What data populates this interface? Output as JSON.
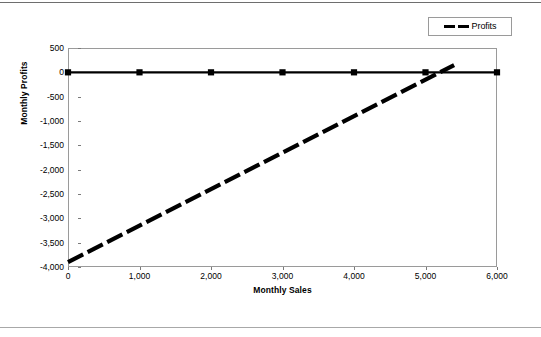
{
  "chart_data": {
    "type": "line",
    "title": "",
    "xlabel": "Monthly Sales",
    "ylabel": "Monthly Profits",
    "xlim": [
      0,
      6000
    ],
    "ylim": [
      -4000,
      500
    ],
    "grid": false,
    "legend_position": "top-right",
    "x_ticks": [
      0,
      1000,
      2000,
      3000,
      4000,
      5000,
      6000
    ],
    "x_tick_labels": [
      "0",
      "1,000",
      "2,000",
      "3,000",
      "4,000",
      "5,000",
      "6,000"
    ],
    "y_ticks": [
      500,
      0,
      -500,
      -1000,
      -1500,
      -2000,
      -2500,
      -3000,
      -3500,
      -4000
    ],
    "y_tick_labels": [
      "500",
      "0",
      "-500",
      "-1,000",
      "-1,500",
      "-2,000",
      "-2,500",
      "-3,000",
      "-3,500",
      "-4,000"
    ],
    "series": [
      {
        "name": "Break-even",
        "style": "solid",
        "marker": "square",
        "color": "#000000",
        "x": [
          0,
          1000,
          2000,
          3000,
          4000,
          5000,
          6000
        ],
        "values": [
          0,
          0,
          0,
          0,
          0,
          0,
          0
        ]
      },
      {
        "name": "Profits",
        "style": "dashed",
        "marker": "none",
        "color": "#000000",
        "x": [
          0,
          5400
        ],
        "values": [
          -3900,
          150
        ]
      }
    ],
    "legend_entries": [
      {
        "label": "Profits",
        "style": "dashed",
        "color": "#000000"
      }
    ],
    "annotations": []
  },
  "legend": {
    "profits_label": "Profits"
  },
  "axes": {
    "x_title": "Monthly Sales",
    "y_title": "Monthly Profits"
  }
}
